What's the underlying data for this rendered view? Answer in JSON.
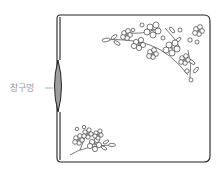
{
  "diagram": {
    "callout_label": "창구멍",
    "colors": {
      "outline": "#222222",
      "opening_fill": "#9e9e9e",
      "label": "#9a9a9a",
      "background": "#ffffff"
    },
    "elements": [
      {
        "name": "pouch-outline",
        "shape": "square with rounded right corners, double-line left edge"
      },
      {
        "name": "opening",
        "shape": "lens-shaped gap on left edge, filled grey"
      },
      {
        "name": "floral-embroidery-top-right",
        "shape": "cherry-blossom corner spray"
      },
      {
        "name": "floral-embroidery-bottom-left",
        "shape": "small blossom spray"
      }
    ]
  }
}
